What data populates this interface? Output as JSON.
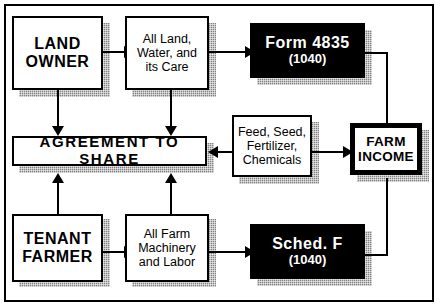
{
  "diagram": {
    "colors": {
      "ink": "#000000",
      "paper": "#ffffff",
      "shadow": "#808080"
    },
    "nodes": {
      "land_owner": {
        "label": "LAND\nOWNER"
      },
      "all_land": {
        "label": "All Land,\nWater, and\nits Care"
      },
      "form_4835": {
        "label": "Form  4835",
        "sublabel": "(1040)"
      },
      "agreement": {
        "label": "AGREEMENT TO SHARE"
      },
      "feed_seed": {
        "label": "Feed, Seed,\nFertilizer,\nChemicals"
      },
      "farm_income": {
        "label": "FARM",
        "sublabel": "INCOME"
      },
      "tenant_farmer": {
        "label": "TENANT\nFARMER"
      },
      "all_farm": {
        "label": "All Farm\nMachinery\nand Labor"
      },
      "sched_f": {
        "label": "Sched.  F",
        "sublabel": "(1040)"
      }
    },
    "connectors": [
      {
        "name": "land-owner-to-all-land",
        "direction": "right"
      },
      {
        "name": "land-owner-to-agreement",
        "direction": "down"
      },
      {
        "name": "all-land-to-agreement",
        "direction": "down"
      },
      {
        "name": "all-land-to-form-4835",
        "direction": "right"
      },
      {
        "name": "feed-seed-to-agreement",
        "direction": "left"
      },
      {
        "name": "feed-seed-to-farm-income",
        "direction": "right"
      },
      {
        "name": "farm-income-to-form-4835",
        "direction": "left"
      },
      {
        "name": "farm-income-to-sched-f",
        "direction": "left"
      },
      {
        "name": "tenant-farmer-to-agreement",
        "direction": "up"
      },
      {
        "name": "tenant-farmer-to-all-farm",
        "direction": "right"
      },
      {
        "name": "all-farm-to-agreement",
        "direction": "up"
      },
      {
        "name": "all-farm-to-sched-f",
        "direction": "right"
      }
    ]
  }
}
